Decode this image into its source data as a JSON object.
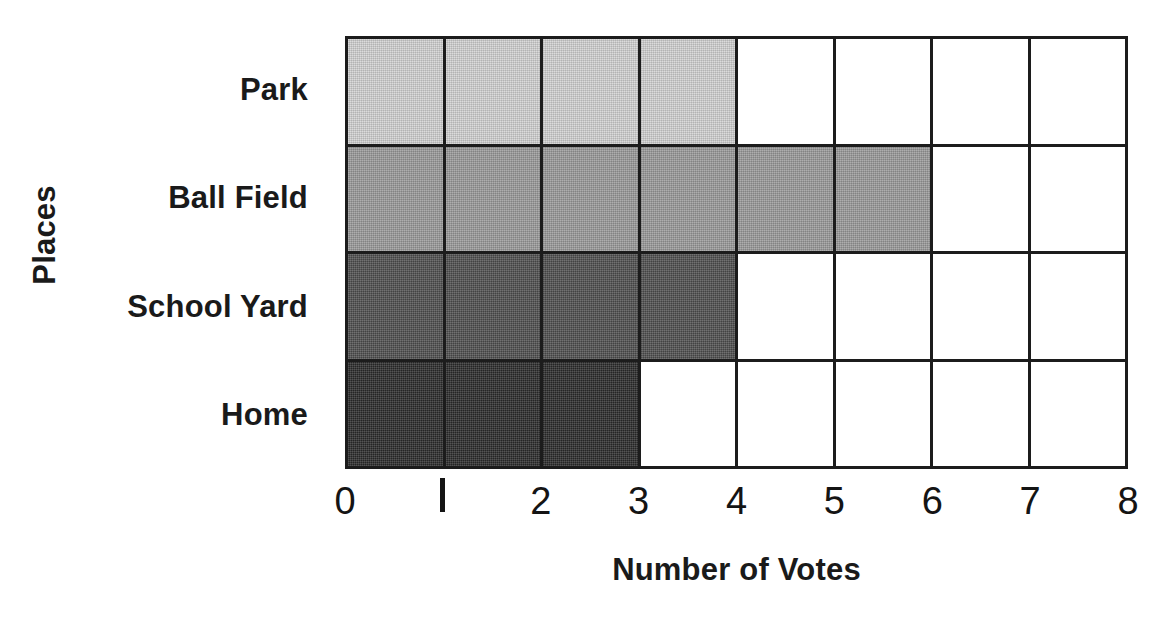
{
  "chart_data": {
    "type": "bar",
    "orientation": "horizontal",
    "title": "",
    "xlabel": "Number of Votes",
    "ylabel": "Places",
    "categories": [
      "Park",
      "Ball Field",
      "School Yard",
      "Home"
    ],
    "values": [
      4,
      6,
      4,
      3
    ],
    "bar_colors": [
      "#d2d2d2",
      "#9a9a9a",
      "#4f4f4f",
      "#2b2b2b"
    ],
    "xlim": [
      0,
      8
    ],
    "xticks": [
      0,
      1,
      2,
      3,
      4,
      5,
      6,
      7,
      8
    ],
    "xtick_labels": [
      "0",
      "1",
      "2",
      "3",
      "4",
      "5",
      "6",
      "7",
      "8"
    ],
    "grid": true,
    "grid_color": "#1c1c1c",
    "legend": "none",
    "background": "#ffffff",
    "series": [
      {
        "name": "Votes",
        "values": [
          4,
          6,
          4,
          3
        ]
      }
    ],
    "points": [
      {
        "category": "Park",
        "value": 4,
        "color": "#d2d2d2"
      },
      {
        "category": "Ball Field",
        "value": 6,
        "color": "#9a9a9a"
      },
      {
        "category": "School Yard",
        "value": 4,
        "color": "#4f4f4f"
      },
      {
        "category": "Home",
        "value": 3,
        "color": "#2b2b2b"
      }
    ]
  }
}
